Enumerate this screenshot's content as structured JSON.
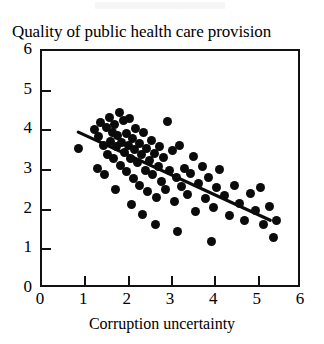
{
  "chart_data": {
    "type": "scatter",
    "title": "Quality of public health care provision",
    "xlabel": "Corruption uncertainty",
    "ylabel": "",
    "xlim": [
      0,
      6
    ],
    "ylim": [
      0,
      6
    ],
    "xticks": [
      0,
      1,
      2,
      3,
      4,
      5,
      6
    ],
    "yticks": [
      0,
      1,
      2,
      3,
      4,
      5,
      6
    ],
    "grid": false,
    "legend": null,
    "marker": "filled-circle",
    "trendline": {
      "type": "linear-fit",
      "x_start": 0.85,
      "y_start": 3.92,
      "x_end": 5.35,
      "y_end": 1.66,
      "slope": -0.5,
      "intercept": 4.35
    },
    "points": [
      [
        0.85,
        3.55
      ],
      [
        1.2,
        4.02
      ],
      [
        1.3,
        3.85
      ],
      [
        1.35,
        4.2
      ],
      [
        1.42,
        3.62
      ],
      [
        1.48,
        4.08
      ],
      [
        1.52,
        3.4
      ],
      [
        1.55,
        4.32
      ],
      [
        1.58,
        3.72
      ],
      [
        1.62,
        3.95
      ],
      [
        1.65,
        3.28
      ],
      [
        1.68,
        4.15
      ],
      [
        1.72,
        3.58
      ],
      [
        1.75,
        3.88
      ],
      [
        1.78,
        4.45
      ],
      [
        1.8,
        3.12
      ],
      [
        1.84,
        3.7
      ],
      [
        1.88,
        4.25
      ],
      [
        1.9,
        3.45
      ],
      [
        1.94,
        3.92
      ],
      [
        1.96,
        2.95
      ],
      [
        2.0,
        3.62
      ],
      [
        2.02,
        4.3
      ],
      [
        2.05,
        3.3
      ],
      [
        2.08,
        3.8
      ],
      [
        2.1,
        2.78
      ],
      [
        2.14,
        3.52
      ],
      [
        2.16,
        4.05
      ],
      [
        2.2,
        3.18
      ],
      [
        2.24,
        3.68
      ],
      [
        2.26,
        2.62
      ],
      [
        2.3,
        3.4
      ],
      [
        2.34,
        3.95
      ],
      [
        2.38,
        2.98
      ],
      [
        2.4,
        3.55
      ],
      [
        2.44,
        2.45
      ],
      [
        2.48,
        3.25
      ],
      [
        2.52,
        3.75
      ],
      [
        2.56,
        2.88
      ],
      [
        2.6,
        3.42
      ],
      [
        2.64,
        2.3
      ],
      [
        2.68,
        3.08
      ],
      [
        2.72,
        3.6
      ],
      [
        2.76,
        2.7
      ],
      [
        2.8,
        3.32
      ],
      [
        2.85,
        2.52
      ],
      [
        2.9,
        4.22
      ],
      [
        2.95,
        3.0
      ],
      [
        3.0,
        3.48
      ],
      [
        3.05,
        2.2
      ],
      [
        3.1,
        2.82
      ],
      [
        3.18,
        3.62
      ],
      [
        3.22,
        2.58
      ],
      [
        3.28,
        3.05
      ],
      [
        3.35,
        2.38
      ],
      [
        3.42,
        2.9
      ],
      [
        3.5,
        3.35
      ],
      [
        3.55,
        1.95
      ],
      [
        3.62,
        2.65
      ],
      [
        3.7,
        3.1
      ],
      [
        3.78,
        2.28
      ],
      [
        3.85,
        2.82
      ],
      [
        3.95,
        2.05
      ],
      [
        4.02,
        2.55
      ],
      [
        4.1,
        3.02
      ],
      [
        4.2,
        2.35
      ],
      [
        4.32,
        1.85
      ],
      [
        4.45,
        2.62
      ],
      [
        4.55,
        2.15
      ],
      [
        4.68,
        1.72
      ],
      [
        4.8,
        2.42
      ],
      [
        4.92,
        1.98
      ],
      [
        5.05,
        2.55
      ],
      [
        5.12,
        1.62
      ],
      [
        5.25,
        2.08
      ],
      [
        5.35,
        1.3
      ],
      [
        5.42,
        1.72
      ],
      [
        1.45,
        2.88
      ],
      [
        1.7,
        2.52
      ],
      [
        2.06,
        2.12
      ],
      [
        2.32,
        1.88
      ],
      [
        2.62,
        1.62
      ],
      [
        3.12,
        1.45
      ],
      [
        3.9,
        1.2
      ],
      [
        1.28,
        3.05
      ]
    ]
  }
}
